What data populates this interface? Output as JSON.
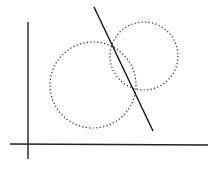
{
  "diagram": {
    "colors": {
      "background": "#ffffff",
      "axis": "#222222",
      "circle": "#333333",
      "line": "#111111"
    },
    "axes": {
      "x_axis": {
        "x1": 10,
        "y1": 144,
        "x2": 208,
        "y2": 145
      },
      "y_axis": {
        "x1": 28,
        "y1": 22,
        "x2": 28,
        "y2": 159
      }
    },
    "circles": [
      {
        "name": "left-circle",
        "cx": 93,
        "cy": 85,
        "r": 43,
        "style": "dotted"
      },
      {
        "name": "right-circle",
        "cx": 144,
        "cy": 56,
        "r": 34,
        "style": "dotted"
      }
    ],
    "line": {
      "name": "line-through-intersections",
      "x1": 94,
      "y1": 7,
      "x2": 153,
      "y2": 131,
      "style": "solid"
    },
    "intersections": [
      {
        "x": 112,
        "y": 45
      },
      {
        "x": 135,
        "y": 92
      }
    ]
  }
}
